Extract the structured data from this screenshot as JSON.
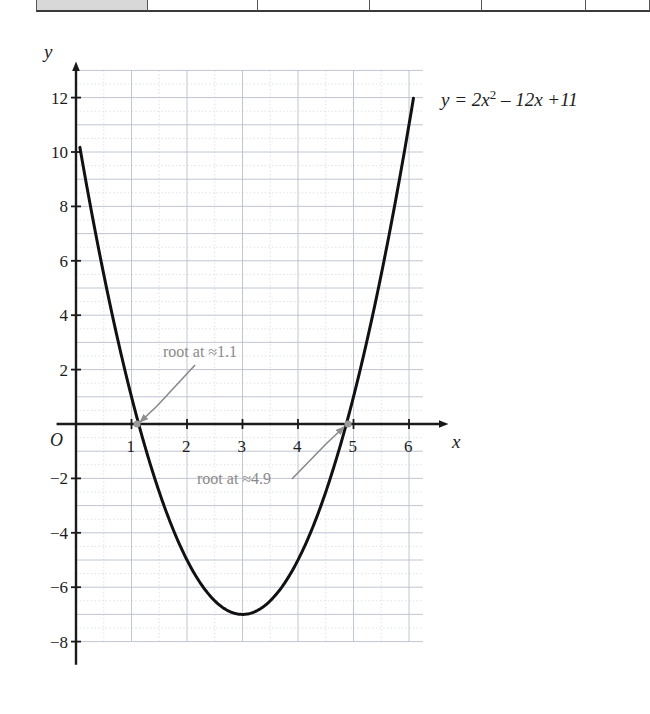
{
  "table_strip": {
    "cells": [
      {
        "x": 36,
        "w": 112,
        "filled": true
      },
      {
        "x": 148,
        "w": 110,
        "filled": false
      },
      {
        "x": 258,
        "w": 112,
        "filled": false
      },
      {
        "x": 370,
        "w": 112,
        "filled": false
      },
      {
        "x": 482,
        "w": 104,
        "filled": false
      },
      {
        "x": 586,
        "w": 64,
        "filled": false
      }
    ]
  },
  "chart_data": {
    "type": "line",
    "title": "",
    "equation_label": {
      "prefix": "y = 2x",
      "exponent": "2",
      "suffix": " – 12x +11",
      "plain": "y = 2x² – 12x +11"
    },
    "function": "y = 2x^2 - 12x + 11",
    "coefficients": {
      "a": 2,
      "b": -12,
      "c": 11
    },
    "vertex": {
      "x": 3,
      "y": -7
    },
    "roots": [
      1.1,
      4.9
    ],
    "xlabel": "x",
    "ylabel": "y",
    "origin_label": "O",
    "xlim": [
      -0.35,
      6.6
    ],
    "ylim": [
      -8.9,
      13.1
    ],
    "x_ticks": [
      1,
      2,
      3,
      4,
      5,
      6
    ],
    "x_tick_labels": [
      "1",
      "2",
      "3",
      "4",
      "5",
      "6"
    ],
    "y_ticks": [
      12,
      10,
      8,
      6,
      4,
      2,
      -2,
      -4,
      -6,
      -8
    ],
    "y_tick_labels": [
      "12",
      "10",
      "8",
      "6",
      "4",
      "2",
      "−2",
      "−4",
      "−6",
      "−8"
    ],
    "grid": {
      "major_step_x": 1,
      "major_step_y": 1,
      "minor_step_x": 0.5,
      "minor_step_y": 0.5,
      "major_color": "#b9c0ce",
      "minor_color": "#cfd5e0",
      "x_range": [
        0,
        6.25
      ],
      "y_range": [
        -8,
        13
      ]
    },
    "curve_domain": [
      0.07,
      6.08
    ],
    "legend": "none",
    "series": [
      {
        "name": "y = 2x² – 12x + 11",
        "color": "#111111",
        "points_x": [
          0.07,
          0.5,
          1.0,
          1.1,
          1.5,
          2.0,
          2.5,
          3.0,
          3.5,
          4.0,
          4.5,
          4.9,
          5.0,
          5.5,
          6.0,
          6.08
        ],
        "points_y": [
          10.17,
          5.5,
          1.0,
          0.22,
          -2.5,
          -5.0,
          -6.5,
          -7.0,
          -6.5,
          -5.0,
          -2.5,
          0.22,
          1.0,
          5.5,
          11.0,
          12.0
        ]
      }
    ],
    "annotations": [
      {
        "text": "root at ≈1.1",
        "target_x": 1.1,
        "target_y": 0,
        "color": "#8a8a8a"
      },
      {
        "text": "root at ≈4.9",
        "target_x": 4.9,
        "target_y": 0,
        "color": "#8a8a8a"
      }
    ],
    "colors": {
      "curve": "#111111",
      "axis": "#1a1a1a",
      "grid_major": "#b9c0ce",
      "grid_minor": "#cfd5e0",
      "annotation": "#8a8a8a",
      "background": "#ffffff"
    }
  }
}
